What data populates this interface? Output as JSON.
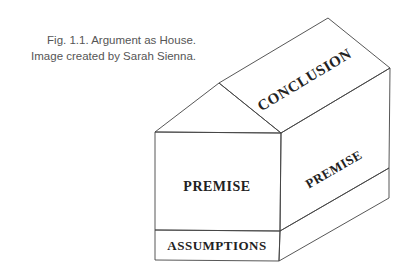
{
  "caption": {
    "line1": "Fig. 1.1. Argument as House.",
    "line2": "Image created by Sarah Sienna."
  },
  "diagram": {
    "type": "argument-house",
    "stroke_color": "#444444",
    "labels": {
      "roof": "CONCLUSION",
      "front_wall": "PREMISE",
      "side_wall": "PREMISE",
      "foundation": "ASSUMPTIONS"
    }
  }
}
